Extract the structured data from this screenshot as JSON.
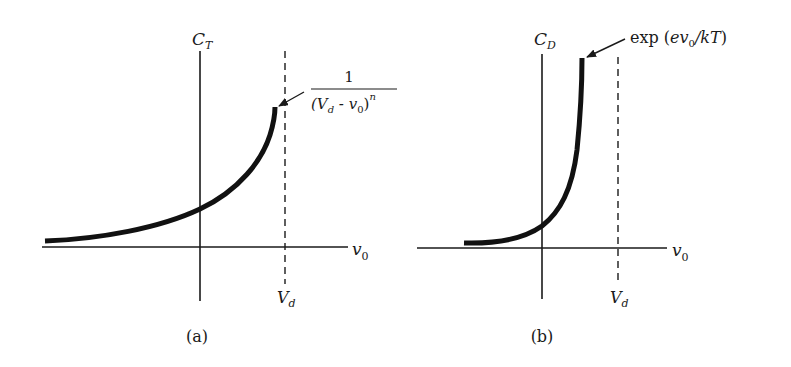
{
  "panels": [
    {
      "id": "a",
      "caption": "(a)",
      "y_axis_label": {
        "main": "C",
        "sub": "T"
      },
      "x_axis_label": {
        "main": "v",
        "sub": "0"
      },
      "asymptote_label": {
        "main": "V",
        "sub": "d"
      },
      "annotation": {
        "numerator": "1",
        "denominator_open": "(V",
        "denominator_sub_d": "d",
        "denominator_mid": " - v",
        "denominator_sub_0": "0",
        "denominator_close": ")",
        "exponent": "n"
      },
      "curve_description": "Junction (transition) capacitance rising toward the dashed asymptote at V_d"
    },
    {
      "id": "b",
      "caption": "(b)",
      "y_axis_label": {
        "main": "C",
        "sub": "D"
      },
      "x_axis_label": {
        "main": "v",
        "sub": "0"
      },
      "asymptote_label": {
        "main": "V",
        "sub": "d"
      },
      "annotation": {
        "prefix": "exp (",
        "e": "ev",
        "sub_0": "0",
        "rest": "/kT",
        "close": ")"
      },
      "curve_description": "Diffusion capacitance rising exponentially with v0"
    }
  ],
  "colors": {
    "ink": "#1a1a1a",
    "background": "#ffffff"
  }
}
